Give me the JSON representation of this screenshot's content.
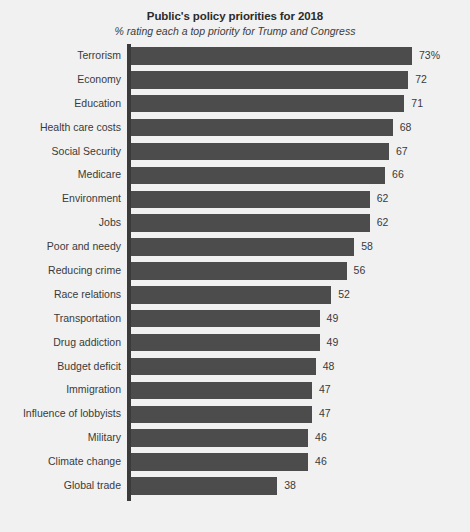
{
  "chart_data": {
    "type": "bar",
    "orientation": "horizontal",
    "title": "Public's policy priorities for 2018",
    "subtitle": "% rating each a top priority for Trump and Congress",
    "xlabel": "",
    "ylabel": "",
    "xlim": [
      0,
      73
    ],
    "grid": false,
    "legend": null,
    "bar_color": "#4c4c4c",
    "background_color": "#f1f1f1",
    "axis_color": "#3b3b3b",
    "categories": [
      "Terrorism",
      "Economy",
      "Education",
      "Health care costs",
      "Social Security",
      "Medicare",
      "Environment",
      "Jobs",
      "Poor and needy",
      "Reducing crime",
      "Race relations",
      "Transportation",
      "Drug addiction",
      "Budget deficit",
      "Immigration",
      "Influence of lobbyists",
      "Military",
      "Climate change",
      "Global trade"
    ],
    "values": [
      73,
      72,
      71,
      68,
      67,
      66,
      62,
      62,
      58,
      56,
      52,
      49,
      49,
      48,
      47,
      47,
      46,
      46,
      38
    ],
    "value_labels": [
      "73%",
      "72",
      "71",
      "68",
      "67",
      "66",
      "62",
      "62",
      "58",
      "56",
      "52",
      "49",
      "49",
      "48",
      "47",
      "47",
      "46",
      "46",
      "38"
    ]
  }
}
